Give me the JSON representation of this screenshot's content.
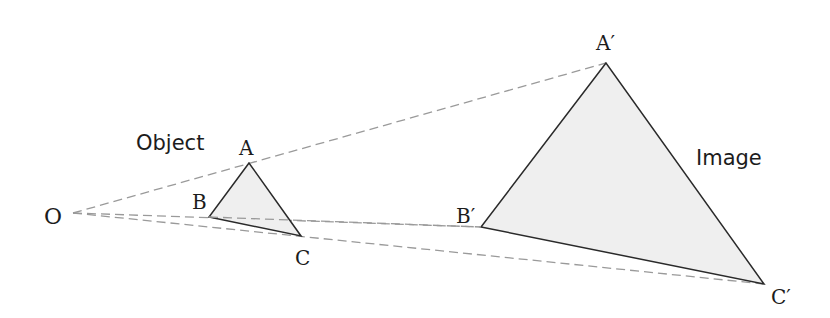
{
  "diagram": {
    "colors": {
      "background": "#ffffff",
      "triangle_fill": "#efefef",
      "triangle_stroke": "#2a2a2a",
      "projection_dash": "#9a9a9a",
      "text": "#1c1c1c"
    },
    "center": {
      "label": "O",
      "x": 73,
      "y": 213
    },
    "object": {
      "caption": "Object",
      "vertices": [
        {
          "label": "A",
          "x": 249,
          "y": 163
        },
        {
          "label": "B",
          "x": 209,
          "y": 217
        },
        {
          "label": "C",
          "x": 301,
          "y": 236
        }
      ]
    },
    "image": {
      "caption": "Image",
      "vertices": [
        {
          "label": "A′",
          "x": 606,
          "y": 63
        },
        {
          "label": "B′",
          "x": 481,
          "y": 227
        },
        {
          "label": "C′",
          "x": 764,
          "y": 284
        }
      ]
    },
    "projection_lines": [
      {
        "from": "O",
        "to": "A′"
      },
      {
        "from": "O",
        "to": "B′"
      },
      {
        "from": "O",
        "to": "C′"
      }
    ]
  }
}
